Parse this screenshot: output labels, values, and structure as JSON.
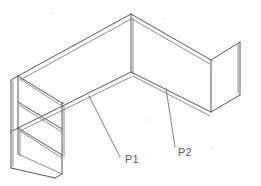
{
  "drawing": {
    "title": "Isometric bent sheet-metal channel part",
    "view": "isometric",
    "background_color": "#ffffff",
    "line_color": "#55565a",
    "line_color_light": "#7d7e82",
    "text_color": "#58595d",
    "canvas": {
      "width": 261,
      "height": 186
    }
  },
  "callouts": [
    {
      "id": "p1",
      "label": "P1",
      "label_x": 125,
      "label_y": 163,
      "leader": {
        "x1": 89,
        "y1": 96,
        "x2": 120,
        "y2": 157
      },
      "points_to": "left-inclined-web-face"
    },
    {
      "id": "p2",
      "label": "P2",
      "label_x": 178,
      "label_y": 156,
      "leader": {
        "x1": 166,
        "y1": 88,
        "x2": 175,
        "y2": 147
      },
      "points_to": "right-inclined-web-face"
    }
  ],
  "geometry": {
    "outer_top_profile": "M 18,76 L 131,14 L 211,60 L 240,42",
    "outer_bottom_profile": "M 18,128 L 64,103 L 131,72 L 211,112 L 240,95",
    "note": "thin-walled bent plate, two vertical webs meeting at a central bend"
  }
}
